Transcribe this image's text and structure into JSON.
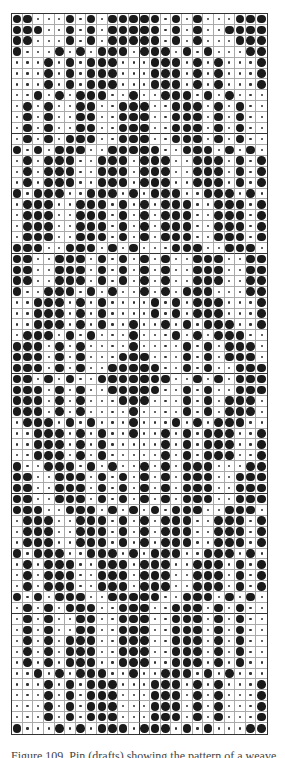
{
  "figure": {
    "caption": "Figure 109. Pin (drafts) showing the pattern of a weave",
    "columns": 24,
    "rows": 66,
    "section_rows": 11,
    "half_columns": 12,
    "colors": {
      "filled_dot": "#1a1a1a",
      "empty_dot": "#333333",
      "grid_line": "#aaaaaa",
      "divider": "#333333"
    },
    "legend": {
      "1": "large filled dot",
      "0": "small dot"
    },
    "pattern": [
      "110001010111110101000111",
      "111001010111110101001111",
      "110001010111110101000111",
      "100010101110111010100011",
      "000101011100011101010001",
      "000101011100011101010001",
      "000101011100011101010001",
      "001010111001001110101000",
      "010100110011100111010100",
      "010100110011100111010100",
      "010100110011100111010100",
      "010101110011100111010100",
      "101011100111110011101010",
      "010111001110111001110101",
      "010111001110111001110101",
      "010111001110111001110101",
      "101110011101011100111010",
      "011100111010101110011101",
      "011100111010101110011101",
      "011100111010101110011101",
      "011100111010101110011101",
      "111001110101000111001110",
      "110011101010101001110011",
      "110011101010101001110011",
      "110011101010101001110011",
      "100111010100101011100011",
      "001110101000010101110001",
      "001110101000010101110001",
      "001110101001001010111001",
      "011101010001000101011100",
      "111010100001000010101110",
      "111010100011100010101110",
      "111010100111110010100111",
      "110101001111111001010111",
      "111010100111110010100111",
      "111010100011100010101110",
      "111010100001000010101110",
      "011101010001000101011100",
      "001110101001001010111001",
      "001110101000001010111001",
      "001110101000001010111001",
      "100111010100101011100011",
      "110011101010101011100111",
      "110011101010101011100111",
      "110011101010101011100111",
      "111001110101010111001110",
      "011100111010101110011101",
      "011100111010101110011101",
      "011100111010101110011101",
      "101110011101011100111010",
      "010111001110111001110101",
      "010111001110111001110101",
      "010111001110111001110101",
      "101011100111110011101010",
      "010101110011100111010100",
      "010100110011100111010100",
      "010100110011100111010100",
      "010101110011100111010100",
      "010101110011100111010100",
      "010101110011100111010100",
      "001010111001001110101000",
      "000101011100011101010001",
      "000101011100011101010001",
      "000101011100011101010001",
      "000101011100011101010001",
      "100010101110111010100011"
    ]
  }
}
